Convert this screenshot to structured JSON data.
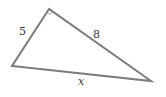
{
  "diagram": {
    "type": "right-triangle",
    "vertices": {
      "right_angle": {
        "x": 49,
        "y": 9
      },
      "left": {
        "x": 12,
        "y": 66
      },
      "right": {
        "x": 151,
        "y": 81
      }
    },
    "sides": [
      {
        "name": "leg-left",
        "label": "5",
        "from": "left",
        "to": "right_angle"
      },
      {
        "name": "hypotenuse-or-leg",
        "label": "8",
        "from": "right_angle",
        "to": "right"
      },
      {
        "name": "base",
        "label": "x",
        "from": "left",
        "to": "right"
      }
    ],
    "right_angle_marker": true,
    "colors": {
      "line": "#7a7a7a",
      "text": "#333333",
      "background": "#ffffff"
    }
  }
}
